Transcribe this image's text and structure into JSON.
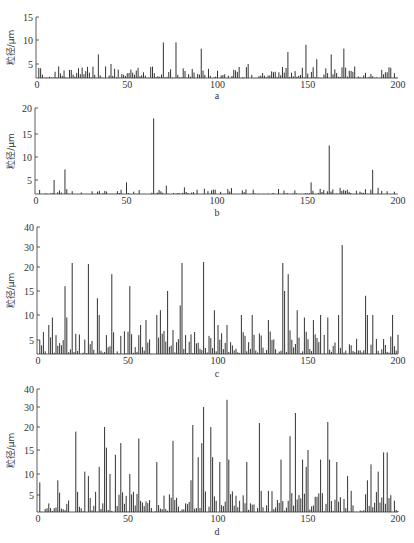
{
  "figure": {
    "ylabel": "粒径/μm",
    "xticks": [
      "0",
      "50",
      "100",
      "150",
      "200"
    ]
  },
  "chart_data": [
    {
      "id": "a",
      "type": "bar",
      "caption": "a",
      "xlabel": "",
      "ylabel": "粒径/μm",
      "xlim": [
        0,
        200
      ],
      "ylim": [
        2,
        15
      ],
      "yticks": [
        5,
        10,
        15
      ],
      "xticks": [
        0,
        50,
        100,
        150,
        200
      ],
      "grid": false,
      "peaks": [
        [
          34,
          7
        ],
        [
          38,
          4.5
        ],
        [
          41,
          5
        ],
        [
          70,
          9.5
        ],
        [
          77,
          9.5
        ],
        [
          91,
          8.2
        ],
        [
          117,
          5
        ],
        [
          139,
          7.5
        ],
        [
          149,
          9
        ],
        [
          155,
          6
        ],
        [
          163,
          7
        ],
        [
          170,
          8.2
        ]
      ],
      "baseline_range": [
        2,
        4.5
      ],
      "n_points": 200
    },
    {
      "id": "b",
      "type": "bar",
      "caption": "b",
      "xlabel": "",
      "ylabel": "粒径/μm",
      "xlim": [
        0,
        200
      ],
      "ylim": [
        2,
        20
      ],
      "yticks": [
        5,
        10,
        15,
        20
      ],
      "xticks": [
        0,
        50,
        100,
        150,
        200
      ],
      "grid": false,
      "peaks": [
        [
          10,
          5
        ],
        [
          16,
          7.3
        ],
        [
          50,
          4.5
        ],
        [
          65,
          18
        ],
        [
          72,
          3.8
        ],
        [
          152,
          4.5
        ],
        [
          162,
          12.5
        ],
        [
          186,
          7.2
        ]
      ],
      "baseline_range": [
        2,
        3.5
      ],
      "n_points": 200
    },
    {
      "id": "c",
      "type": "bar",
      "caption": "c",
      "xlabel": "",
      "ylabel": "粒径/μm",
      "xlim": [
        0,
        200
      ],
      "ylim": [
        2,
        40
      ],
      "yticks": [
        5,
        10,
        15,
        20,
        30,
        40
      ],
      "yscale": "nonlinear",
      "xticks": [
        0,
        50,
        100,
        150,
        200
      ],
      "grid": false,
      "peaks": [
        [
          6,
          8
        ],
        [
          8,
          9.5
        ],
        [
          15,
          16
        ],
        [
          16,
          9.5
        ],
        [
          19,
          22
        ],
        [
          28,
          21.5
        ],
        [
          33,
          13.5
        ],
        [
          34,
          10
        ],
        [
          41,
          18.5
        ],
        [
          51,
          16
        ],
        [
          57,
          8
        ],
        [
          60,
          9
        ],
        [
          66,
          10
        ],
        [
          68,
          11
        ],
        [
          72,
          15
        ],
        [
          79,
          12
        ],
        [
          80,
          22
        ],
        [
          92,
          22.5
        ],
        [
          98,
          11
        ],
        [
          100,
          8
        ],
        [
          105,
          8
        ],
        [
          113,
          10
        ],
        [
          119,
          10
        ],
        [
          128,
          9
        ],
        [
          136,
          22
        ],
        [
          137,
          15
        ],
        [
          139,
          18.5
        ],
        [
          144,
          11
        ],
        [
          148,
          9.5
        ],
        [
          153,
          9
        ],
        [
          157,
          10
        ],
        [
          161,
          9.5
        ],
        [
          167,
          10
        ],
        [
          169,
          31
        ],
        [
          182,
          14
        ],
        [
          183,
          10
        ],
        [
          186,
          10
        ],
        [
          197,
          10
        ]
      ],
      "baseline_range": [
        2,
        7
      ],
      "n_points": 200
    },
    {
      "id": "d",
      "type": "bar",
      "caption": "d",
      "xlabel": "",
      "ylabel": "粒径/μm",
      "xlim": [
        0,
        200
      ],
      "ylim": [
        2,
        40
      ],
      "yticks": [
        5,
        10,
        15,
        20,
        30,
        40
      ],
      "yscale": "nonlinear",
      "xticks": [
        0,
        50,
        100,
        150,
        200
      ],
      "grid": false,
      "peaks": [
        [
          1,
          8
        ],
        [
          11,
          8.5
        ],
        [
          21,
          19
        ],
        [
          26,
          10.5
        ],
        [
          28,
          9.5
        ],
        [
          34,
          11.5
        ],
        [
          37,
          20
        ],
        [
          38,
          15.5
        ],
        [
          40,
          10
        ],
        [
          43,
          14
        ],
        [
          46,
          16.5
        ],
        [
          51,
          10
        ],
        [
          56,
          17.5
        ],
        [
          66,
          12.5
        ],
        [
          75,
          17
        ],
        [
          85,
          8.5
        ],
        [
          86,
          21
        ],
        [
          89,
          13.5
        ],
        [
          91,
          16.5
        ],
        [
          92,
          30
        ],
        [
          96,
          20
        ],
        [
          97,
          13.5
        ],
        [
          101,
          12.5
        ],
        [
          105,
          34
        ],
        [
          106,
          13
        ],
        [
          116,
          12.5
        ],
        [
          123,
          22
        ],
        [
          135,
          13
        ],
        [
          140,
          18
        ],
        [
          143,
          27
        ],
        [
          147,
          13
        ],
        [
          149,
          11.5
        ],
        [
          150,
          15
        ],
        [
          157,
          13
        ],
        [
          161,
          22.5
        ],
        [
          162,
          13
        ],
        [
          166,
          12.5
        ],
        [
          172,
          9.5
        ],
        [
          183,
          8.5
        ],
        [
          185,
          12
        ],
        [
          189,
          10.5
        ],
        [
          192,
          14.5
        ],
        [
          194,
          14.5
        ],
        [
          201,
          18
        ]
      ],
      "baseline_range": [
        2,
        6
      ],
      "n_points": 200
    }
  ]
}
